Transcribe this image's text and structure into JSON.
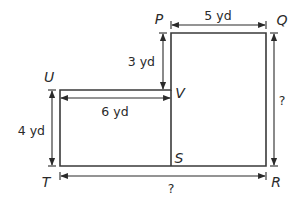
{
  "figure": {
    "vertices": {
      "P": "P",
      "Q": "Q",
      "R": "R",
      "S": "S",
      "T": "T",
      "U": "U",
      "V": "V"
    },
    "measurements": {
      "PQ": "5 yd",
      "PV": "3 yd",
      "UV": "6 yd",
      "UT": "4 yd",
      "QR": "?",
      "TR": "?"
    },
    "colors": {
      "stroke": "#3a3a3a",
      "text": "#2a2a2a",
      "background": "#ffffff"
    }
  }
}
